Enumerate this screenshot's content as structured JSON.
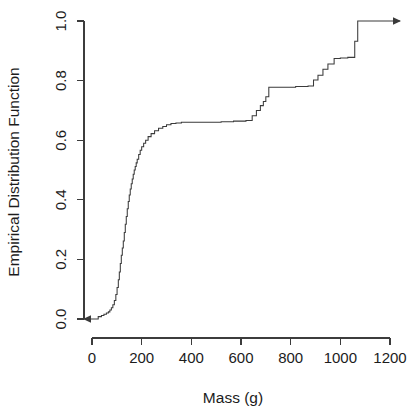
{
  "chart_data": {
    "type": "line",
    "subtype": "ecdf-step",
    "title": "",
    "xlabel": "Mass (g)",
    "ylabel": "Empirical Distribution Function",
    "xlim": [
      -50,
      1250
    ],
    "ylim": [
      0.0,
      1.0
    ],
    "xticks": [
      0,
      200,
      400,
      600,
      800,
      1000,
      1200
    ],
    "xtick_labels": [
      "0",
      "200",
      "400",
      "600",
      "800",
      "1000",
      "1200"
    ],
    "yticks": [
      0.0,
      0.2,
      0.4,
      0.6,
      0.8,
      1.0
    ],
    "ytick_labels": [
      "0.0",
      "0.2",
      "0.4",
      "0.6",
      "0.8",
      "1.0"
    ],
    "grid": false,
    "legend": false,
    "line_color": "#3a3a3a",
    "axis_color": "#3c3c3c",
    "background_color": "#ffffff",
    "start_arrow": true,
    "end_arrow": true,
    "x": [
      -40,
      10,
      25,
      38,
      48,
      58,
      66,
      72,
      78,
      84,
      90,
      96,
      101,
      106,
      110,
      114,
      118,
      122,
      126,
      130,
      134,
      138,
      142,
      146,
      150,
      154,
      158,
      162,
      166,
      170,
      174,
      178,
      182,
      188,
      194,
      200,
      208,
      216,
      226,
      238,
      252,
      268,
      285,
      300,
      318,
      338,
      360,
      390,
      420,
      470,
      520,
      570,
      620,
      645,
      662,
      678,
      690,
      700,
      712,
      760,
      820,
      870,
      892,
      910,
      930,
      950,
      975,
      1000,
      1030,
      1058,
      1070,
      1250
    ],
    "y": [
      0.0,
      0.0,
      0.008,
      0.012,
      0.016,
      0.02,
      0.024,
      0.03,
      0.038,
      0.048,
      0.062,
      0.082,
      0.106,
      0.132,
      0.158,
      0.186,
      0.214,
      0.238,
      0.262,
      0.29,
      0.318,
      0.344,
      0.37,
      0.394,
      0.416,
      0.436,
      0.454,
      0.47,
      0.486,
      0.5,
      0.512,
      0.524,
      0.536,
      0.552,
      0.566,
      0.578,
      0.59,
      0.6,
      0.612,
      0.622,
      0.632,
      0.64,
      0.646,
      0.652,
      0.656,
      0.658,
      0.66,
      0.66,
      0.66,
      0.66,
      0.662,
      0.664,
      0.666,
      0.682,
      0.7,
      0.716,
      0.73,
      0.746,
      0.778,
      0.778,
      0.78,
      0.782,
      0.802,
      0.818,
      0.838,
      0.856,
      0.874,
      0.876,
      0.878,
      0.932,
      1.0,
      1.0
    ]
  },
  "axis": {
    "x_title": "Mass (g)",
    "y_title": "Empirical Distribution Function"
  }
}
